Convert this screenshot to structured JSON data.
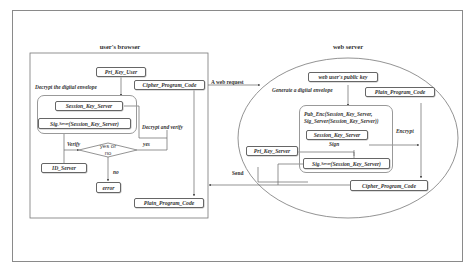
{
  "browser": {
    "title": "user's browser",
    "pri_key_user": "Pri_Key_User",
    "decrypt_envelope": "Decrypt the digital envelope",
    "cipher_code": "Cipher_Program_Code",
    "session_key": "Session_Key_Server",
    "sig_prefix": "Sig",
    "sig_sub": "_Server",
    "sig_arg": "(Session_Key_Server)",
    "decrypt_verify": "Decrypt and verify",
    "verify": "Verify",
    "yes": "yes",
    "decision_line1": "yes or",
    "decision_line2": "no",
    "id_server": "ID_Server",
    "no": "no",
    "error": "error",
    "plain_code": "Plain_Program_Code"
  },
  "connectors": {
    "web_request": "A web request",
    "send": "Send"
  },
  "server": {
    "title": "web server",
    "public_key": "web user's public key",
    "generate_envelope": "Generate a digital envelope",
    "plain_code": "Plain_Program_Code",
    "pub_enc_line1": "Pub_Enc(Session_Key_Server,",
    "pub_enc_line2": "Sig_Server(Session_Key_Server))",
    "session_key": "Session_Key_Server",
    "encrypt": "Encrypt",
    "sign": "Sign",
    "pri_key_server": "Pri_Key_Server",
    "sig_prefix": "Sig",
    "sig_sub": "_Server",
    "sig_arg": "(Session_Key_Server)",
    "cipher_code": "Cipher_Program_Code"
  }
}
